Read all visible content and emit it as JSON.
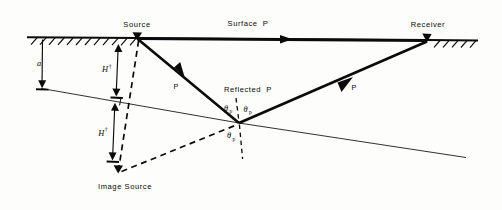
{
  "figure": {
    "domain": "diagram"
  },
  "labels": {
    "source": "Source",
    "receiver": "Receiver",
    "surface_p": "Surface  P",
    "reflected_p": "Reflected  P",
    "image_source": "Image Source",
    "ray_p_down": "P",
    "ray_p_up": "P",
    "depth_a": "a",
    "height_h_upper": "H",
    "height_h_lower": "H",
    "height_dagger": "†",
    "theta_symbol": "θ",
    "theta_subscript": "p"
  },
  "angles": [
    {
      "name": "theta-p-incident",
      "symbol": "θ",
      "subscript": "p"
    },
    {
      "name": "theta-p-reflected",
      "symbol": "θ",
      "subscript": "p"
    },
    {
      "name": "theta-p-image",
      "symbol": "θ",
      "subscript": "p"
    }
  ],
  "colors": {
    "ink": "#0b0b0b",
    "background": "#fdfdfb",
    "interface": "#1a1a1a"
  },
  "geometry": {
    "source": {
      "x": 137,
      "y": 38
    },
    "receiver": {
      "x": 427,
      "y": 40
    },
    "reflection_point": {
      "x": 239,
      "y": 123
    },
    "image_source": {
      "x": 118,
      "y": 172
    },
    "surface_y": 38,
    "interface_left": {
      "x": 41,
      "y": 88
    },
    "interface_right": {
      "x": 466,
      "y": 157
    }
  }
}
